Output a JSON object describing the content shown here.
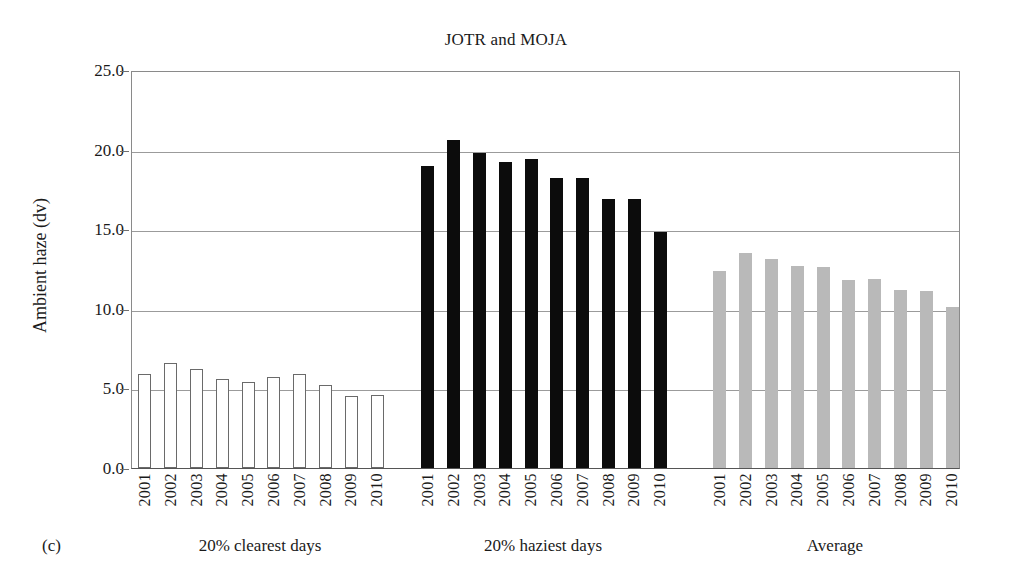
{
  "chart_data": {
    "type": "bar",
    "title": "JOTR and MOJA",
    "panel_label": "(c)",
    "xlabel": "",
    "ylabel": "Ambient haze (dv)",
    "ylim": [
      0.0,
      25.0
    ],
    "ytick_labels": [
      "0.0",
      "5.0",
      "10.0",
      "15.0",
      "20.0",
      "25.0"
    ],
    "yticks": [
      0.0,
      5.0,
      10.0,
      15.0,
      20.0,
      25.0
    ],
    "grid": true,
    "legend": "none",
    "categories": [
      "2001",
      "2002",
      "2003",
      "2004",
      "2005",
      "2006",
      "2007",
      "2008",
      "2009",
      "2010"
    ],
    "groups": [
      {
        "name": "20% clearest days",
        "style": "white-outlined",
        "color": "#ffffff",
        "edge_color": "#6a6a6a",
        "values": [
          5.9,
          6.6,
          6.2,
          5.6,
          5.4,
          5.7,
          5.9,
          5.2,
          4.5,
          4.6
        ]
      },
      {
        "name": "20% haziest days",
        "style": "solid-black",
        "color": "#0c0c0c",
        "edge_color": "#0c0c0c",
        "values": [
          19.0,
          20.6,
          19.8,
          19.2,
          19.4,
          18.2,
          18.2,
          16.9,
          16.9,
          14.8
        ]
      },
      {
        "name": "Average",
        "style": "solid-gray",
        "color": "#b9b9b9",
        "edge_color": "#b9b9b9",
        "values": [
          12.4,
          13.5,
          13.1,
          12.7,
          12.6,
          11.8,
          11.9,
          11.2,
          11.1,
          10.1
        ]
      }
    ]
  }
}
